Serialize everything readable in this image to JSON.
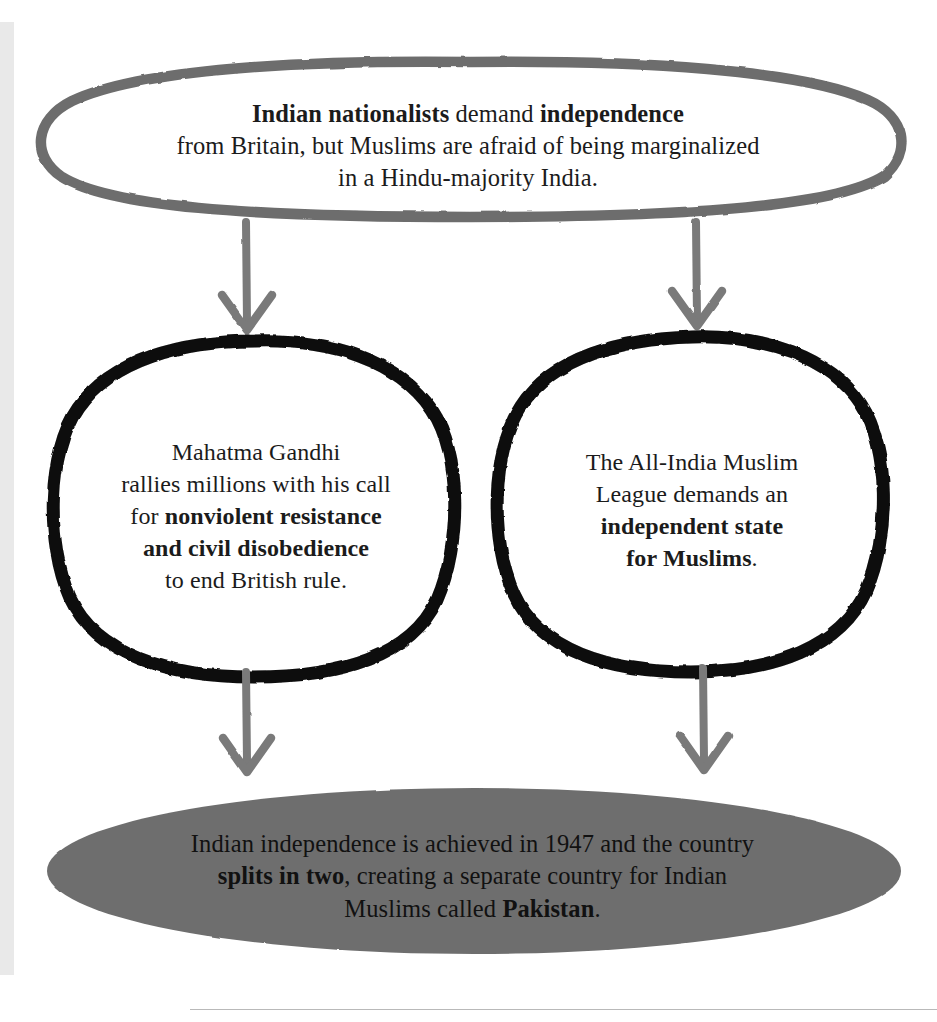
{
  "diagram": {
    "type": "flowchart",
    "colors": {
      "top_node_stroke": "#6d6d6d",
      "branch_node_stroke": "#000000",
      "outcome_node_fill": "#6e6e6e",
      "arrow": "#7a7a7a",
      "text": "#1b1b1b",
      "page_background": "#ffffff",
      "gutter_strip": "#e9e9e9",
      "footer_rule": "#b9b9b9"
    },
    "nodes": {
      "top": {
        "shape": "hand-drawn-ellipse-outline",
        "lines": [
          {
            "segments": [
              {
                "text": "Indian nationalists",
                "bold": true
              },
              {
                "text": " demand ",
                "bold": false
              },
              {
                "text": "independence",
                "bold": true
              }
            ]
          },
          {
            "segments": [
              {
                "text": "from Britain, but Muslims are afraid of being marginalized",
                "bold": false
              }
            ]
          },
          {
            "segments": [
              {
                "text": "in a Hindu-majority India.",
                "bold": false
              }
            ]
          }
        ]
      },
      "left": {
        "shape": "hand-drawn-circle-outline",
        "lines": [
          {
            "segments": [
              {
                "text": "Mahatma Gandhi",
                "bold": false
              }
            ]
          },
          {
            "segments": [
              {
                "text": "rallies millions with his call",
                "bold": false
              }
            ]
          },
          {
            "segments": [
              {
                "text": "for ",
                "bold": false
              },
              {
                "text": "nonviolent resistance",
                "bold": true
              }
            ]
          },
          {
            "segments": [
              {
                "text": "and civil disobedience",
                "bold": true
              }
            ]
          },
          {
            "segments": [
              {
                "text": "to end British rule.",
                "bold": false
              }
            ]
          }
        ]
      },
      "right": {
        "shape": "hand-drawn-circle-outline",
        "lines": [
          {
            "segments": [
              {
                "text": "The All-India Muslim",
                "bold": false
              }
            ]
          },
          {
            "segments": [
              {
                "text": "League demands an",
                "bold": false
              }
            ]
          },
          {
            "segments": [
              {
                "text": "independent state",
                "bold": true
              }
            ]
          },
          {
            "segments": [
              {
                "text": "for Muslims",
                "bold": true
              },
              {
                "text": ".",
                "bold": false
              }
            ]
          }
        ]
      },
      "bottom": {
        "shape": "filled-ellipse",
        "lines": [
          {
            "segments": [
              {
                "text": "Indian independence is achieved in 1947 and the country",
                "bold": false
              }
            ]
          },
          {
            "segments": [
              {
                "text": "splits in two",
                "bold": true
              },
              {
                "text": ", creating a separate country for Indian",
                "bold": false
              }
            ]
          },
          {
            "segments": [
              {
                "text": "Muslims called ",
                "bold": false
              },
              {
                "text": "Pakistan",
                "bold": true
              },
              {
                "text": ".",
                "bold": false
              }
            ]
          }
        ]
      }
    },
    "connectors": [
      {
        "name": "top-to-left",
        "from": "top",
        "to": "left",
        "style": "down-arrow"
      },
      {
        "name": "top-to-right",
        "from": "top",
        "to": "right",
        "style": "down-arrow"
      },
      {
        "name": "left-to-bottom",
        "from": "left",
        "to": "bottom",
        "style": "down-arrow"
      },
      {
        "name": "right-to-bottom",
        "from": "right",
        "to": "bottom",
        "style": "down-arrow"
      }
    ]
  }
}
